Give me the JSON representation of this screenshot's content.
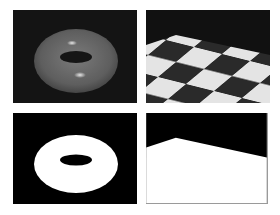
{
  "figure": {
    "layout": "2x2 grid",
    "panels": [
      {
        "position": "top-left",
        "content": "shaded torus",
        "background": "#141414",
        "object_color": "#6e6e6e",
        "highlight": "#d0d0d0"
      },
      {
        "position": "top-right",
        "content": "checkerboard floor in perspective",
        "background": "#111111",
        "light_tile": "#e6e6e6",
        "dark_tile": "#2a2a2a"
      },
      {
        "position": "bottom-left",
        "content": "torus silhouette mask",
        "background": "#000000",
        "object_color": "#ffffff"
      },
      {
        "position": "bottom-right",
        "content": "floor plane silhouette mask",
        "background": "#000000",
        "object_color": "#ffffff"
      }
    ]
  }
}
